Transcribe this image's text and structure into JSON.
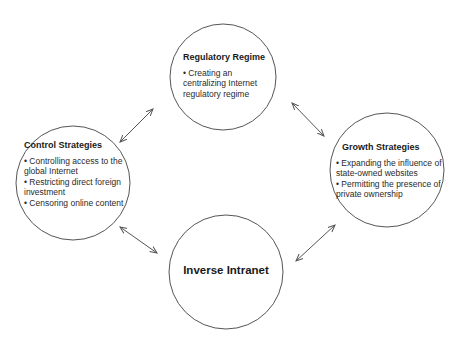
{
  "diagram": {
    "type": "cycle",
    "colors": {
      "stroke": "#555555",
      "text": "#1a1a1a",
      "background": "#ffffff"
    },
    "nodes": {
      "regulatory": {
        "title": "Regulatory Regime",
        "bullets": [
          "• Creating an centralizing Internet regulatory regime"
        ]
      },
      "control": {
        "title": "Control Strategies",
        "bullets": [
          "• Controlling access to the global Internet",
          "• Restricting direct foreign investment",
          "• Censoring online content"
        ]
      },
      "growth": {
        "title": "Growth Strategies",
        "bullets": [
          "• Expanding the influence of state-owned websites",
          "• Permitting the presence of private ownership"
        ]
      },
      "center": {
        "title": "Inverse Intranet"
      }
    },
    "edges": [
      {
        "from": "control",
        "to": "regulatory",
        "type": "bidirectional-arrow"
      },
      {
        "from": "regulatory",
        "to": "growth",
        "type": "bidirectional-arrow"
      },
      {
        "from": "control",
        "to": "center",
        "type": "bidirectional-arrow"
      },
      {
        "from": "center",
        "to": "growth",
        "type": "bidirectional-arrow"
      }
    ]
  }
}
